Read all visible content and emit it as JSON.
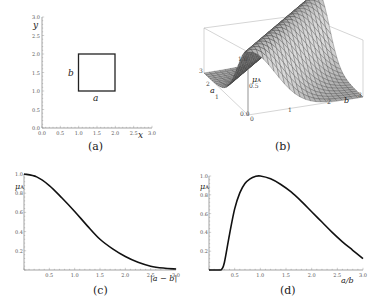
{
  "figure": {
    "panels": [
      {
        "id": "a",
        "caption": "(a)"
      },
      {
        "id": "b",
        "caption": "(b)"
      },
      {
        "id": "c",
        "caption": "(c)"
      },
      {
        "id": "d",
        "caption": "(d)"
      }
    ]
  },
  "chart_data": [
    {
      "type": "diagram",
      "title": "",
      "caption": "(a)",
      "xlabel": "x",
      "ylabel": "y",
      "xlim": [
        0,
        3
      ],
      "ylim": [
        0,
        3
      ],
      "xticks": [
        "0.0",
        "0.5",
        "1.0",
        "1.5",
        "2.0",
        "2.5",
        "3.0"
      ],
      "yticks": [
        "0.0",
        "0.5",
        "1.0",
        "1.5",
        "2.0",
        "2.5",
        "3.0"
      ],
      "square": {
        "x0": 1.0,
        "y0": 1.0,
        "x1": 2.0,
        "y1": 2.0
      },
      "side_labels": {
        "bottom": "a",
        "left": "b"
      }
    },
    {
      "type": "surface",
      "caption": "(b)",
      "xlabel": "b",
      "ylabel": "a",
      "zlabel": "μA",
      "xticks": [
        "0",
        "1",
        "2",
        "3"
      ],
      "yticks": [
        "1",
        "2",
        "3"
      ],
      "zticks": [
        "0.0",
        "0.5",
        "1.0"
      ],
      "description": "Gaussian ridge along a = b, peak μA = 1.0"
    },
    {
      "type": "line",
      "caption": "(c)",
      "xlabel": "|a − b|",
      "ylabel": "μA",
      "xlim": [
        0,
        3
      ],
      "ylim": [
        0,
        1
      ],
      "xticks": [
        "0.5",
        "1.0",
        "1.5",
        "2.0",
        "2.5",
        "3.0"
      ],
      "yticks": [
        "0.2",
        "0.4",
        "0.6",
        "0.8",
        "1.0"
      ],
      "x": [
        0,
        0.25,
        0.5,
        0.75,
        1.0,
        1.25,
        1.5,
        1.75,
        2.0,
        2.25,
        2.5,
        2.75,
        3.0
      ],
      "values": [
        1.0,
        0.97,
        0.88,
        0.75,
        0.61,
        0.46,
        0.32,
        0.22,
        0.14,
        0.08,
        0.04,
        0.02,
        0.01
      ]
    },
    {
      "type": "line",
      "caption": "(d)",
      "xlabel": "a/b",
      "ylabel": "μA",
      "xlim": [
        0,
        3
      ],
      "ylim": [
        0,
        1
      ],
      "xticks": [
        "0.5",
        "1.0",
        "1.5",
        "2.0",
        "2.5",
        "3.0"
      ],
      "yticks": [
        "0.2",
        "0.4",
        "0.6",
        "0.8",
        "1.0"
      ],
      "x": [
        0,
        0.2,
        0.25,
        0.3,
        0.4,
        0.5,
        0.6,
        0.7,
        0.8,
        0.9,
        1.0,
        1.2,
        1.4,
        1.6,
        1.8,
        2.0,
        2.2,
        2.4,
        2.6,
        2.8,
        3.0
      ],
      "values": [
        0,
        0,
        0.01,
        0.08,
        0.38,
        0.65,
        0.82,
        0.92,
        0.97,
        0.995,
        1.0,
        0.97,
        0.91,
        0.83,
        0.73,
        0.62,
        0.51,
        0.4,
        0.3,
        0.21,
        0.12
      ]
    }
  ]
}
